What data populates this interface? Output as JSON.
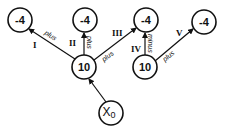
{
  "diagram": {
    "type": "tree",
    "nodes": [
      {
        "id": "n1",
        "label": "-4",
        "x": 20,
        "y": 20
      },
      {
        "id": "n2",
        "label": "-4",
        "x": 85,
        "y": 20
      },
      {
        "id": "n3",
        "label": "-4",
        "x": 146,
        "y": 20
      },
      {
        "id": "n4",
        "label": "-4",
        "x": 204,
        "y": 22
      },
      {
        "id": "n5",
        "label": "10",
        "x": 84,
        "y": 67
      },
      {
        "id": "n6",
        "label": "10",
        "x": 145,
        "y": 67
      },
      {
        "id": "n7",
        "label": "X",
        "sub": "0",
        "x": 111,
        "y": 113
      }
    ],
    "edges": [
      {
        "from": "n5",
        "to": "n1",
        "roman": "I",
        "op": "plus"
      },
      {
        "from": "n5",
        "to": "n2",
        "roman": "II",
        "op": "plus"
      },
      {
        "from": "n5",
        "to": "n3",
        "roman": "III",
        "op": "plus"
      },
      {
        "from": "n6",
        "to": "n3",
        "roman": "IV",
        "op": "minus"
      },
      {
        "from": "n6",
        "to": "n4",
        "roman": "V",
        "op": "plus"
      },
      {
        "from": "n7",
        "to": "n5",
        "roman": "",
        "op": ""
      }
    ]
  }
}
